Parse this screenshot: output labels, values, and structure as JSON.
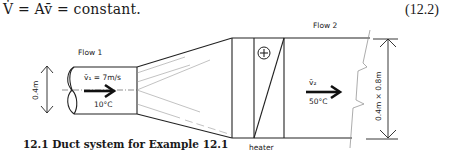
{
  "equation": {
    "text": "V̇ = Av̄ = constant.",
    "number": "(12.2)"
  },
  "figure": {
    "caption": "12.1 Duct system for Example 12.1",
    "flow1": {
      "label": "Flow 1",
      "velocity": "v̄₁ = 7m/s",
      "temperature": "10°C",
      "dimension": "0.4m"
    },
    "flow2": {
      "label": "Flow 2",
      "velocity": "v̄₂",
      "temperature": "50°C",
      "dimension": "0.4m × 0.8m"
    },
    "heater": {
      "label": "heater",
      "symbol": "+"
    }
  }
}
